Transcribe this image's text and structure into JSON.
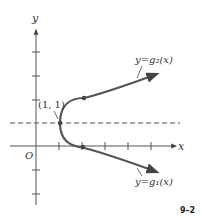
{
  "figure": {
    "id_label": "9–2",
    "axes": {
      "x_label": "x",
      "y_label": "y",
      "origin_label": "O"
    },
    "point_label": "(1, 1)",
    "curves": [
      {
        "name": "upper",
        "label": "y=g₂(x)"
      },
      {
        "name": "lower",
        "label": "y=g₁(x)"
      }
    ],
    "dashed_line": "y = 1",
    "colors": {
      "curve": "#555555",
      "axes": "#555555",
      "text": "#333333"
    }
  }
}
